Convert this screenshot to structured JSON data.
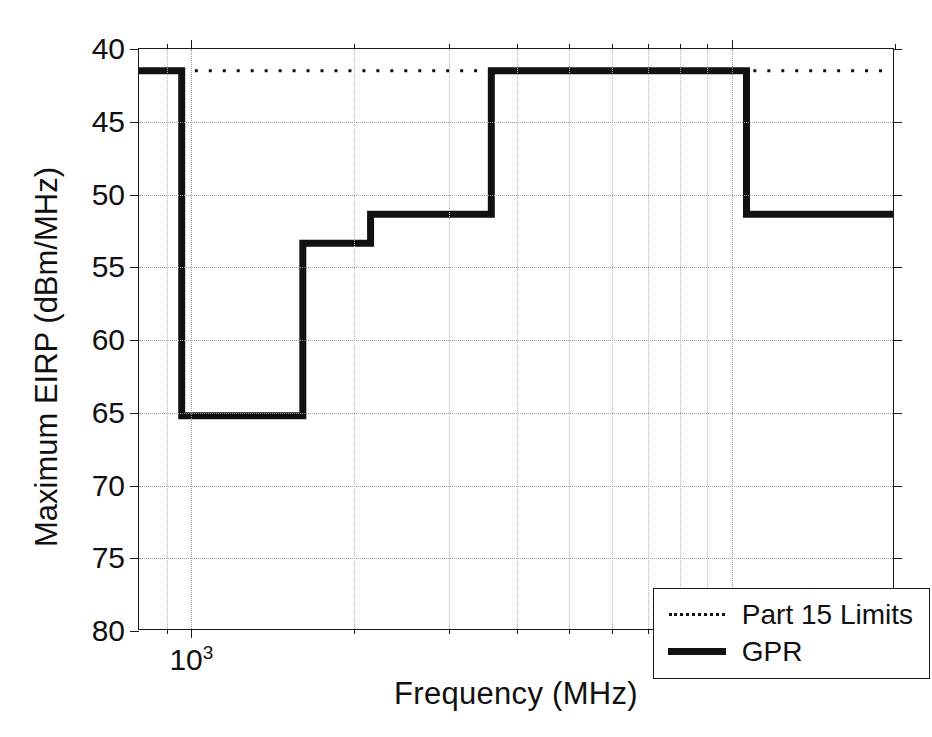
{
  "chart_data": {
    "type": "line",
    "title": "",
    "xlabel": "Frequency  (MHz)",
    "ylabel": "Maximum EIRP (dBm/MHz)",
    "xscale": "log",
    "xlim": [
      800,
      20000
    ],
    "ylim": [
      40,
      80
    ],
    "y_inverted": true,
    "grid": true,
    "legend_position": "lower right",
    "xticks": [
      {
        "value": 1000,
        "label": "10",
        "exponent": "3"
      },
      {
        "value": 10000,
        "label": "10",
        "exponent": "4"
      }
    ],
    "xminor_ticks": [
      900,
      2000,
      3000,
      4000,
      5000,
      6000,
      7000,
      8000,
      9000,
      20000
    ],
    "yticks": [
      40,
      45,
      50,
      55,
      60,
      65,
      70,
      75,
      80
    ],
    "ytick_labels": [
      "40",
      "45",
      "50",
      "55",
      "60",
      "65",
      "70",
      "75",
      "80"
    ],
    "series": [
      {
        "name": "Part 15 Limits",
        "style": "dotted",
        "color": "#111111",
        "linewidth": 3,
        "points": [
          {
            "x": 800,
            "y": 41.5
          },
          {
            "x": 20000,
            "y": 41.5
          }
        ]
      },
      {
        "name": "GPR",
        "style": "solid",
        "color": "#111111",
        "linewidth": 7,
        "step": "post",
        "points": [
          {
            "x": 800,
            "y": 41.5
          },
          {
            "x": 960,
            "y": 41.5
          },
          {
            "x": 960,
            "y": 65.3
          },
          {
            "x": 1610,
            "y": 65.3
          },
          {
            "x": 1610,
            "y": 53.4
          },
          {
            "x": 2150,
            "y": 53.4
          },
          {
            "x": 2150,
            "y": 51.4
          },
          {
            "x": 3600,
            "y": 51.4
          },
          {
            "x": 3600,
            "y": 41.5
          },
          {
            "x": 10700,
            "y": 41.5
          },
          {
            "x": 10700,
            "y": 51.4
          },
          {
            "x": 20000,
            "y": 51.4
          }
        ]
      }
    ]
  },
  "legend": {
    "entries": [
      {
        "label": "Part 15 Limits",
        "style": "dotted"
      },
      {
        "label": "GPR",
        "style": "solid"
      }
    ]
  }
}
